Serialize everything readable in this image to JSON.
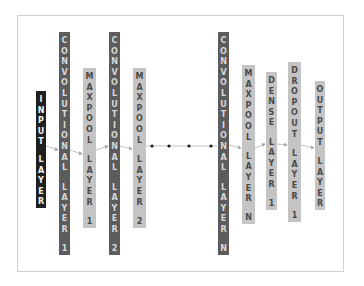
{
  "diagram": {
    "type": "CNN architecture",
    "layers": [
      {
        "id": "input",
        "label": "INPUT LAYER",
        "lines": [
          "INPUT",
          "LAYER"
        ],
        "shade": "dark",
        "x": 36,
        "y": 91,
        "w": 10,
        "h": 117
      },
      {
        "id": "conv1",
        "label": "CONVOLUTIONAL LAYER 1",
        "lines": [
          "CONVOLUTIONAL",
          "LAYER",
          "1"
        ],
        "shade": "mid",
        "x": 59,
        "y": 32,
        "w": 11,
        "h": 223
      },
      {
        "id": "maxpool1",
        "label": "MAXPOOL LAYER 1",
        "lines": [
          "MAXPOOL",
          "LAYER",
          "1"
        ],
        "shade": "light",
        "x": 83,
        "y": 68,
        "w": 13,
        "h": 160
      },
      {
        "id": "conv2",
        "label": "CONVOLUTIONAL LAYER 2",
        "lines": [
          "CONVOLUTIONAL",
          "LAYER",
          "2"
        ],
        "shade": "mid",
        "x": 109,
        "y": 32,
        "w": 11,
        "h": 223
      },
      {
        "id": "maxpool2",
        "label": "MAXPOOL LAYER 2",
        "lines": [
          "MAXPOOL",
          "LAYER",
          "2"
        ],
        "shade": "light",
        "x": 133,
        "y": 68,
        "w": 13,
        "h": 160
      },
      {
        "id": "convN",
        "label": "CONVOLUTIONAL LAYER N",
        "lines": [
          "CONVOLUTIONAL",
          "LAYER",
          "N"
        ],
        "shade": "mid",
        "x": 218,
        "y": 32,
        "w": 11,
        "h": 223
      },
      {
        "id": "maxpoolN",
        "label": "MAXPOOL LAYER N",
        "lines": [
          "MAXPOOL",
          "LAYER",
          "N"
        ],
        "shade": "light",
        "x": 242,
        "y": 65,
        "w": 13,
        "h": 159
      },
      {
        "id": "dense1",
        "label": "DENSE LAYER 1",
        "lines": [
          "DENSE",
          "LAYER",
          "1"
        ],
        "shade": "light",
        "x": 266,
        "y": 72,
        "w": 11,
        "h": 138
      },
      {
        "id": "dropout1",
        "label": "DROPOUT LAYER 1",
        "lines": [
          "DROPOUT",
          "LAYER",
          "1"
        ],
        "shade": "light",
        "x": 288,
        "y": 62,
        "w": 13,
        "h": 160
      },
      {
        "id": "output",
        "label": "OUTPUT LAYER",
        "lines": [
          "OUTPUT",
          "LAYER"
        ],
        "shade": "light",
        "x": 315,
        "y": 81,
        "w": 10,
        "h": 129
      }
    ],
    "ellipsis_dots": 4,
    "colors": {
      "dark": "#1f1f1f",
      "mid": "#5c5c5c",
      "light": "#c4c4c4",
      "arrow": "#b0b0b0",
      "frame": "#d0d0d0"
    }
  }
}
